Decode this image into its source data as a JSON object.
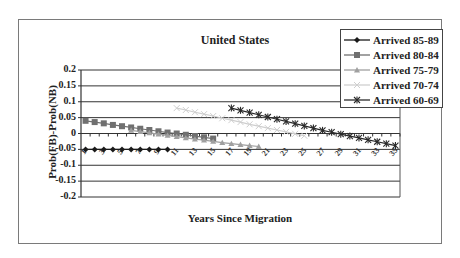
{
  "chart_data": {
    "type": "line",
    "title": "United States",
    "xlabel": "Years Since Migration",
    "ylabel": "Prob(FB)-Prob(NB)",
    "ylim": [
      -0.2,
      0.2
    ],
    "yticks": [
      "0.2",
      "0.15",
      "0.1",
      "0.05",
      "0",
      "-0.05",
      "-0.1",
      "-0.15",
      "-0.2"
    ],
    "x": [
      1,
      2,
      3,
      4,
      5,
      6,
      7,
      8,
      9,
      10,
      11,
      12,
      13,
      14,
      15,
      16,
      17,
      18,
      19,
      20,
      21,
      22,
      23,
      24,
      25,
      26,
      27,
      28,
      29,
      30,
      31,
      32,
      33,
      34,
      35
    ],
    "xticks": [
      "1",
      "3",
      "5",
      "7",
      "9",
      "11",
      "13",
      "15",
      "17",
      "19",
      "21",
      "23",
      "25",
      "27",
      "29",
      "31",
      "33",
      "35"
    ],
    "grid": true,
    "legend_position": "top-right",
    "series": [
      {
        "name": "Arrived 85-89",
        "marker": "diamond",
        "color": "#1a1a1a",
        "x": [
          1,
          2,
          3,
          4,
          5,
          6,
          7,
          8,
          9,
          10
        ],
        "values": [
          -0.05,
          -0.05,
          -0.05,
          -0.05,
          -0.05,
          -0.05,
          -0.05,
          -0.05,
          -0.05,
          -0.05
        ]
      },
      {
        "name": "Arrived 80-84",
        "marker": "square",
        "color": "#707070",
        "x": [
          1,
          2,
          3,
          4,
          5,
          6,
          7,
          8,
          9,
          10,
          11,
          12,
          13,
          14,
          15
        ],
        "values": [
          0.04,
          0.036,
          0.032,
          0.027,
          0.023,
          0.019,
          0.015,
          0.011,
          0.007,
          0.003,
          0.0,
          -0.004,
          -0.008,
          -0.012,
          -0.016
        ]
      },
      {
        "name": "Arrived 75-79",
        "marker": "triangle",
        "color": "#a0a0a0",
        "x": [
          6,
          7,
          8,
          9,
          10,
          11,
          12,
          13,
          14,
          15,
          16,
          17,
          18,
          19,
          20
        ],
        "values": [
          0.01,
          0.006,
          0.002,
          -0.002,
          -0.006,
          -0.01,
          -0.014,
          -0.018,
          -0.021,
          -0.025,
          -0.029,
          -0.032,
          -0.035,
          -0.038,
          -0.041
        ]
      },
      {
        "name": "Arrived 70-74",
        "marker": "x",
        "color": "#cfcfcf",
        "x": [
          11,
          12,
          13,
          14,
          15,
          16,
          17,
          18,
          19,
          20,
          21,
          22,
          23,
          24,
          25
        ],
        "values": [
          0.08,
          0.074,
          0.067,
          0.061,
          0.055,
          0.048,
          0.042,
          0.036,
          0.029,
          0.023,
          0.017,
          0.011,
          0.005,
          -0.001,
          -0.007
        ]
      },
      {
        "name": "Arrived 60-69",
        "marker": "star",
        "color": "#2a2a2a",
        "x": [
          17,
          18,
          19,
          20,
          21,
          22,
          23,
          24,
          25,
          26,
          27,
          28,
          29,
          30,
          31,
          32,
          33,
          34,
          35
        ],
        "values": [
          0.08,
          0.073,
          0.066,
          0.059,
          0.052,
          0.045,
          0.038,
          0.031,
          0.024,
          0.017,
          0.01,
          0.004,
          -0.002,
          -0.008,
          -0.014,
          -0.02,
          -0.026,
          -0.032,
          -0.038
        ]
      }
    ]
  }
}
